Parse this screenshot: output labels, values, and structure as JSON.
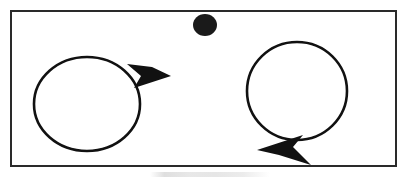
{
  "figure": {
    "background_color": "#ffffff",
    "ink_color": "#111111",
    "caption": "",
    "canvas": {
      "width": 409,
      "height": 181
    }
  },
  "frame": {
    "label": "rectangular border",
    "x": 11,
    "y": 11,
    "width": 385,
    "height": 155,
    "stroke_width": 2,
    "stroke_color": "#2a2a2a",
    "fill": "#ffffff"
  },
  "shapes": {
    "left_circle": {
      "label": "left circle",
      "cx": 87,
      "cy": 104,
      "rx": 53,
      "ry": 47,
      "stroke_width": 2.6,
      "stroke_color": "#111111",
      "fill": "none"
    },
    "right_circle": {
      "label": "right circle",
      "cx": 297,
      "cy": 91,
      "rx": 50,
      "ry": 49,
      "stroke_width": 2.6,
      "stroke_color": "#111111",
      "fill": "none"
    },
    "dot": {
      "label": "filled black dot on top border",
      "cx": 205,
      "cy": 25,
      "rx": 12,
      "ry": 11,
      "fill": "#1a1a1a"
    },
    "left_arrowhead": {
      "label": "arrowhead on left circle pointing right",
      "direction": "right",
      "tip_x": 171,
      "tip_y": 76,
      "fill": "#111111",
      "points": "171,76 134,88 141,76 127,64 152,67"
    },
    "right_arrowhead": {
      "label": "arrowhead on right circle pointing left",
      "direction": "left",
      "tip_x": 257,
      "tip_y": 150,
      "fill": "#111111",
      "points": "257,150 303,135 293,147 311,165 279,155"
    }
  },
  "annotations": {
    "left_group_name": "left circle with outward arrow",
    "right_group_name": "right circle with outward arrow",
    "dot_name": "solid dot marker"
  }
}
